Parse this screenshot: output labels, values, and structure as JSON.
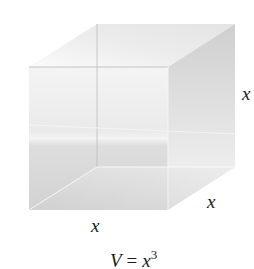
{
  "figure": {
    "labels": {
      "height": "x",
      "depth": "x",
      "width": "x"
    },
    "formula": {
      "lhs": "V",
      "equals": "=",
      "base": "x",
      "exponent": "3"
    }
  }
}
